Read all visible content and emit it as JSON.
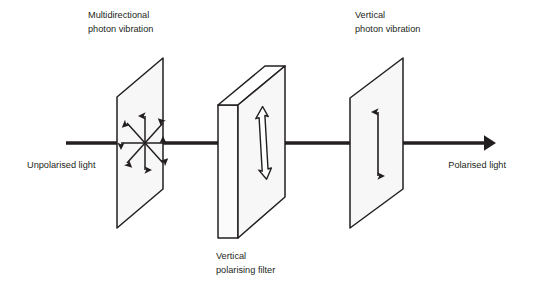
{
  "diagram": {
    "title_text_present": false,
    "background_color": "#ffffff",
    "ink_color": "#231f20",
    "plane_fill_color": "#f7f7f7",
    "labels": {
      "left_beam": "Unpolarised light",
      "right_beam": "Polarised light",
      "plane1_line1": "Multidirectional",
      "plane1_line2": "photon vibration",
      "filter_line1": "Vertical",
      "filter_line2": "polarising filter",
      "plane3_line1": "Vertical",
      "plane3_line2": "photon vibration"
    },
    "beam": {
      "name": "light-beam",
      "y": 143,
      "x_start": 66,
      "x_end": 492,
      "stroke_width": 3.6,
      "arrowhead": "solid-triangle-right"
    },
    "elements": [
      {
        "name": "unpolarised-wave-plane",
        "kind": "parallelogram-plane",
        "vibration": "multidirectional",
        "arrow_style": "solid-thin-double-headed-star",
        "arrow_count": 8,
        "center_x": 145,
        "center_y": 143,
        "radius": 30
      },
      {
        "name": "vertical-polarising-filter",
        "kind": "slab-3d",
        "vibration": "vertical",
        "arrow_style": "hollow-outline-double-headed",
        "center_x": 262,
        "center_y": 143
      },
      {
        "name": "polarised-wave-plane",
        "kind": "parallelogram-plane",
        "vibration": "vertical",
        "arrow_style": "solid-thin-double-headed",
        "center_x": 378,
        "center_y": 143
      }
    ]
  }
}
